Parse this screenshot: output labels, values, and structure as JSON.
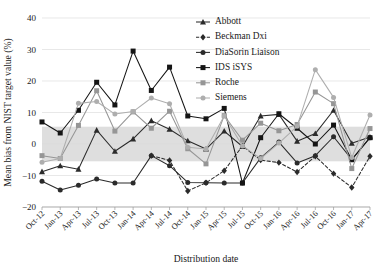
{
  "chart_data": {
    "type": "line",
    "title": "",
    "xlabel": "Distribution date",
    "ylabel": "Mean bias from NIST target value (%)",
    "ylim": [
      -20,
      40
    ],
    "yticks": [
      -20,
      -10,
      0,
      10,
      20,
      30,
      40
    ],
    "ytick_labels": [
      "−20",
      "−10",
      "0",
      "10",
      "20",
      "30",
      "40"
    ],
    "grid": true,
    "legend_position": "top-center",
    "shaded_band": {
      "label": "acceptance band",
      "from": -5.5,
      "to": 5.5,
      "color": "#c9c9c9"
    },
    "categories": [
      "Oct-12",
      "Jan-13",
      "Apr-13",
      "Jul-13",
      "Oct-13",
      "Jan-14",
      "Apr-14",
      "Jul-14",
      "Oct-14",
      "Jan-15",
      "Apr-15",
      "Jul-15",
      "Oct-15",
      "Jan-16",
      "Apr-16",
      "Jul-16",
      "Oct-16",
      "Jan-17",
      "Apr-17"
    ],
    "series": [
      {
        "name": "Abbott",
        "marker": "triangle",
        "color": "#2b2b2b",
        "dash": false,
        "values": [
          -8.8,
          -6.9,
          -8.0,
          4.4,
          -2.3,
          1.6,
          7.4,
          4.7,
          1.0,
          -1.6,
          4.1,
          -0.8,
          8.9,
          9.4,
          0.9,
          3.3,
          10.7,
          0.2,
          2.2
        ]
      },
      {
        "name": "Beckman Dxi",
        "marker": "diamond",
        "color": "#2b2b2b",
        "dash": true,
        "values": [
          null,
          null,
          null,
          null,
          null,
          null,
          -3.7,
          -5.2,
          -14.9,
          -12.3,
          -8.5,
          -0.6,
          -5.1,
          -5.9,
          -8.9,
          -3.9,
          -9.4,
          -13.8,
          -3.9
        ]
      },
      {
        "name": "DiaSorin Liaison",
        "marker": "circle",
        "color": "#2b2b2b",
        "dash": false,
        "values": [
          -11.8,
          -14.6,
          -13.1,
          -11.1,
          -12.4,
          -12.4,
          -3.7,
          -6.9,
          -12.2,
          -12.3,
          -12.4,
          -12.4,
          -4.4,
          0.6,
          -6.0,
          -3.7,
          2.3,
          -4.9,
          2.0
        ]
      },
      {
        "name": "IDS iSYS",
        "marker": "square",
        "color": "#151515",
        "dash": false,
        "values": [
          7.0,
          3.5,
          10.7,
          19.6,
          12.4,
          29.5,
          17.0,
          24.4,
          8.9,
          8.0,
          11.3,
          -12.4,
          2.0,
          9.6,
          5.0,
          0.0,
          6.0,
          -5.0,
          2.0
        ]
      },
      {
        "name": "Roche",
        "marker": "square",
        "color": "#969696",
        "dash": false,
        "values": [
          -3.7,
          -4.6,
          5.9,
          16.9,
          4.1,
          10.2,
          5.0,
          10.4,
          -1.5,
          -6.3,
          9.0,
          1.2,
          6.6,
          4.2,
          6.2,
          16.5,
          12.8,
          -7.8,
          4.9
        ]
      },
      {
        "name": "Siemens",
        "marker": "circle",
        "color": "#aeaeae",
        "dash": false,
        "values": [
          -5.8,
          -4.6,
          12.9,
          13.5,
          9.5,
          10.3,
          14.6,
          12.8,
          -1.0,
          -1.6,
          8.9,
          -0.6,
          -4.6,
          0.3,
          5.6,
          23.6,
          14.8,
          -4.3,
          9.2
        ]
      }
    ]
  }
}
